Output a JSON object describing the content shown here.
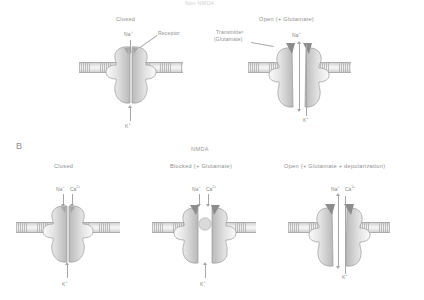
{
  "figure": {
    "top_title": "Non-NMDA",
    "panels": [
      {
        "letter": "A",
        "subtitle": "Non-NMDA",
        "states": [
          {
            "name": "Closed",
            "label": "Closed",
            "ions_in": [
              "Na+"
            ],
            "ions_out": [
              "K+"
            ],
            "annotations": [
              "Receptor"
            ]
          },
          {
            "name": "Open",
            "label": "Open (+ Glutamate)",
            "ions_in": [
              "Na+"
            ],
            "ions_out": [
              "K+"
            ],
            "annotations": [
              "Transmitter",
              "(Glutamate)"
            ]
          }
        ]
      },
      {
        "letter": "B",
        "subtitle": "NMDA",
        "states": [
          {
            "name": "Closed",
            "label": "Closed",
            "ions_in": [
              "Na+",
              "Ca2+"
            ],
            "ions_out": [
              "K+"
            ]
          },
          {
            "name": "Blocked",
            "label": "Blocked (+ Glutamate)",
            "ions_in": [
              "Na+",
              "Ca2+"
            ],
            "ions_out": [
              "K+"
            ]
          },
          {
            "name": "Open",
            "label": "Open (+ Glutamate + depolarization)",
            "ions_in": [
              "Na+",
              "Ca2+"
            ],
            "ions_out": [
              "K+"
            ]
          }
        ]
      }
    ],
    "labels": {
      "panel_a_letter": "A",
      "panel_b_letter": "B",
      "nmda": "NMDA",
      "non_nmda": "Non-NMDA",
      "closed": "Closed",
      "open_glu": "Open (+ Glutamate)",
      "blocked_glu": "Blocked (+ Glutamate)",
      "open_glu_depol": "Open (+ Glutamate + depolarization)",
      "transmitter_line1": "Transmitter",
      "transmitter_line2": "(Glutamate)",
      "receptor": "Receptor",
      "na": "Na",
      "na_charge": "+",
      "k": "K",
      "k_charge": "+",
      "ca": "Ca",
      "ca_charge": "2+"
    },
    "colors": {
      "ink": "#8e8e8e",
      "fill_light": "#f4f4f4",
      "fill_shade": "#c4c4c4",
      "membrane": "#b8b8b8",
      "transmitter": "#8a8a8a",
      "background": "#ffffff"
    }
  }
}
